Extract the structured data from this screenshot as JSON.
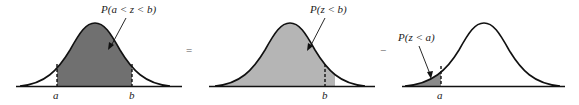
{
  "panels": [
    {
      "id": "between",
      "label": "P(a < z < b)",
      "shade_color": "#707070",
      "shaded_region": "a to b",
      "markers": [
        "a",
        "b"
      ]
    },
    {
      "id": "less-than-b",
      "label": "P(z < b)",
      "shade_color": "#b5b5b5",
      "shaded_region": "left of b",
      "markers": [
        "b"
      ]
    },
    {
      "id": "less-than-a",
      "label": "P(z < a)",
      "shade_color": "#8a8a8a",
      "shaded_region": "left of a",
      "markers": [
        "a"
      ]
    }
  ],
  "operators": {
    "equals": "=",
    "minus": "−"
  },
  "curve_color": "#111111"
}
